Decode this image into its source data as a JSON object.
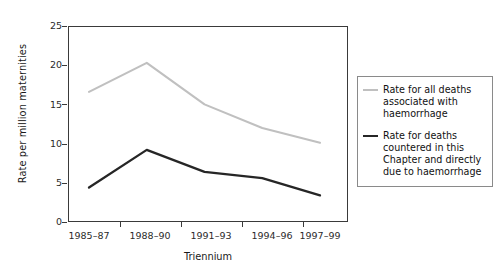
{
  "chart_data": {
    "type": "line",
    "title": "",
    "subtitle": "",
    "xlabel": "Triennium",
    "ylabel": "Rate per million maternities",
    "categories": [
      "1985–87",
      "1988–90",
      "1991–93",
      "1994–96",
      "1997–99"
    ],
    "yticks": [
      "0",
      "5",
      "10",
      "15",
      "20",
      "25"
    ],
    "ylim": [
      0,
      25
    ],
    "grid": false,
    "legend_position": "right",
    "series": [
      {
        "name": "Rate for all deaths associated with haemorrhage",
        "color": "#c0c0c0",
        "values": [
          16.6,
          20.3,
          15.0,
          12.0,
          10.1
        ]
      },
      {
        "name": "Rate for deaths countered in this Chapter and directly due to haemorrhage",
        "color": "#262626",
        "values": [
          4.4,
          9.2,
          6.4,
          5.6,
          3.4
        ]
      }
    ]
  },
  "legend": {
    "entries": [
      {
        "label": "Rate for all deaths associated with haemorrhage"
      },
      {
        "label": "Rate for deaths countered in this Chapter and directly due to haemorrhage"
      }
    ]
  },
  "colors": {
    "series_light": "#c0c0c0",
    "series_dark": "#262626",
    "axis": "#3a3a3a",
    "legend_border": "#8a8a8a",
    "background": "#ffffff"
  }
}
